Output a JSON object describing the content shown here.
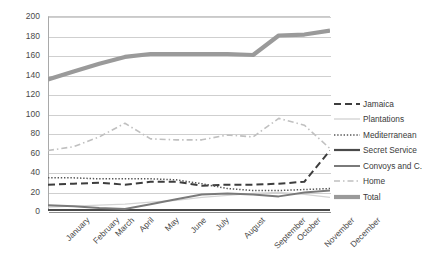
{
  "chart_data": {
    "type": "line",
    "title": "",
    "xlabel": "",
    "ylabel": "",
    "ylim": [
      0,
      200
    ],
    "ytick_step": 20,
    "grid": true,
    "legend_position": "right",
    "categories": [
      "January",
      "February",
      "March",
      "April",
      "May",
      "June",
      "July",
      "August",
      "September",
      "October",
      "November",
      "December"
    ],
    "ytick_labels": [
      "200",
      "180",
      "160",
      "140",
      "120",
      "100",
      "80",
      "60",
      "40",
      "20",
      "0"
    ],
    "series": [
      {
        "name": "Jamaica",
        "style": "dashed",
        "color": "#3d3d3d",
        "width": 2.0,
        "values": [
          27,
          28,
          29,
          27,
          30,
          30,
          26,
          27,
          27,
          28,
          30,
          62
        ]
      },
      {
        "name": "Plantations",
        "style": "solid",
        "color": "#d4d4d4",
        "width": 1.2,
        "values": [
          4,
          5,
          6,
          7,
          9,
          11,
          14,
          16,
          18,
          19,
          17,
          14
        ]
      },
      {
        "name": "Mediterranean",
        "style": "dotted",
        "color": "#555555",
        "width": 1.5,
        "values": [
          34,
          34,
          33,
          33,
          33,
          32,
          28,
          23,
          21,
          21,
          22,
          23
        ]
      },
      {
        "name": "Secret Service",
        "style": "solid",
        "color": "#4a4a4a",
        "width": 2.2,
        "values": [
          1,
          1,
          1,
          1,
          1,
          1,
          1,
          1,
          1,
          1,
          1,
          1
        ]
      },
      {
        "name": "Convoys and C.",
        "style": "solid",
        "color": "#7a7a7a",
        "width": 2.0,
        "values": [
          6,
          5,
          3,
          2,
          7,
          12,
          17,
          18,
          17,
          15,
          19,
          21
        ]
      },
      {
        "name": "Home",
        "style": "dashdot",
        "color": "#c0c0c0",
        "width": 1.6,
        "values": [
          62,
          66,
          76,
          90,
          74,
          73,
          73,
          78,
          76,
          95,
          88,
          64
        ]
      },
      {
        "name": "Total",
        "style": "solid",
        "color": "#9a9a9a",
        "width": 4.2,
        "values": [
          135,
          143,
          151,
          158,
          161,
          161,
          161,
          161,
          160,
          180,
          181,
          185
        ]
      }
    ]
  },
  "legend": {
    "items": [
      {
        "label": "Jamaica"
      },
      {
        "label": "Plantations"
      },
      {
        "label": "Mediterranean"
      },
      {
        "label": "Secret Service"
      },
      {
        "label": "Convoys and C."
      },
      {
        "label": "Home"
      },
      {
        "label": "Total"
      }
    ]
  }
}
